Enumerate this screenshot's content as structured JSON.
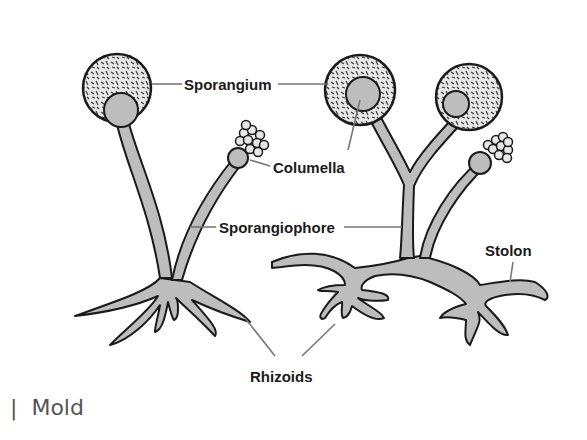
{
  "diagram": {
    "labels": {
      "sporangium": "Sporangium",
      "columella": "Columella",
      "sporangiophore": "Sporangiophore",
      "stolon": "Stolon",
      "rhizoids": "Rhizoids"
    },
    "colors": {
      "outline": "#1a1a1a",
      "hypha_fill": "#bdbdbd",
      "leader_line": "#777777",
      "caption_text": "#555555"
    }
  },
  "caption": {
    "separator": "|",
    "text": "Mold"
  }
}
